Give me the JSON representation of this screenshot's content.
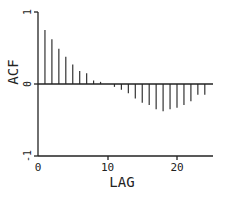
{
  "chart_data": {
    "type": "bar",
    "title": "",
    "xlabel": "LAG",
    "ylabel": "ACF",
    "xlim": [
      0,
      25
    ],
    "ylim": [
      -1,
      1
    ],
    "x_ticks": [
      "0",
      "10",
      "20"
    ],
    "y_ticks": [
      "-1",
      "0",
      "1"
    ],
    "grid": false,
    "categories": [
      0,
      1,
      2,
      3,
      4,
      5,
      6,
      7,
      8,
      9,
      10,
      11,
      12,
      13,
      14,
      15,
      16,
      17,
      18,
      19,
      20,
      21,
      22,
      23,
      24
    ],
    "values": [
      1.0,
      0.75,
      0.62,
      0.49,
      0.38,
      0.27,
      0.18,
      0.15,
      0.05,
      0.03,
      0.0,
      -0.04,
      -0.08,
      -0.13,
      -0.2,
      -0.26,
      -0.29,
      -0.35,
      -0.38,
      -0.35,
      -0.33,
      -0.29,
      -0.24,
      -0.15,
      -0.15
    ]
  }
}
